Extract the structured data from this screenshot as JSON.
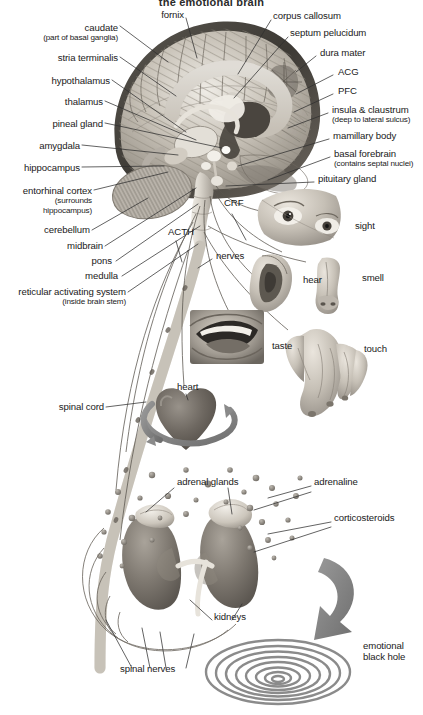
{
  "title": "the emotional brain",
  "figure": {
    "type": "anatomical-diagram",
    "background": "#ffffff",
    "ink": "#1a1a1a"
  },
  "labels": {
    "brain_left": [
      {
        "id": "caudate",
        "text": "caudate",
        "sub": "(part of basal ganglia)",
        "x": 118,
        "y": 28,
        "align": "right"
      },
      {
        "id": "fornix",
        "text": "fornix",
        "sub": "",
        "x": 184,
        "y": 14,
        "align": "right"
      },
      {
        "id": "stria-terminalis",
        "text": "stria terminalis",
        "sub": "",
        "x": 118,
        "y": 57,
        "align": "right"
      },
      {
        "id": "hypothalamus",
        "text": "hypothalamus",
        "sub": "",
        "x": 110,
        "y": 80,
        "align": "right"
      },
      {
        "id": "thalamus",
        "text": "thalamus",
        "sub": "",
        "x": 103,
        "y": 101,
        "align": "right"
      },
      {
        "id": "pineal-gland",
        "text": "pineal gland",
        "sub": "",
        "x": 103,
        "y": 123,
        "align": "right"
      },
      {
        "id": "amygdala",
        "text": "amygdala",
        "sub": "",
        "x": 80,
        "y": 145,
        "align": "right"
      },
      {
        "id": "hippocampus",
        "text": "hippocampus",
        "sub": "",
        "x": 80,
        "y": 167,
        "align": "right"
      },
      {
        "id": "entorhinal-cortex",
        "text": "entorhinal cortex",
        "sub": "(surrounds\nhippocampus)",
        "x": 92,
        "y": 190,
        "align": "right"
      },
      {
        "id": "cerebellum",
        "text": "cerebellum",
        "sub": "",
        "x": 90,
        "y": 229,
        "align": "right"
      },
      {
        "id": "midbrain",
        "text": "midbrain",
        "sub": "",
        "x": 103,
        "y": 245,
        "align": "right"
      },
      {
        "id": "pons",
        "text": "pons",
        "sub": "",
        "x": 114,
        "y": 260,
        "align": "right"
      },
      {
        "id": "medulla",
        "text": "medulla",
        "sub": "",
        "x": 120,
        "y": 275,
        "align": "right"
      },
      {
        "id": "reticular-activating-system",
        "text": "reticular activating system",
        "sub": "(inside brain stem)",
        "x": 126,
        "y": 291,
        "align": "right"
      },
      {
        "id": "spinal-cord",
        "text": "spinal cord",
        "sub": "",
        "x": 104,
        "y": 406,
        "align": "right"
      }
    ],
    "brain_right": [
      {
        "id": "corpus-callosum",
        "text": "corpus callosum",
        "sub": "",
        "x": 273,
        "y": 15,
        "align": "left"
      },
      {
        "id": "septum-pelucidum",
        "text": "septum pelucidum",
        "sub": "",
        "x": 290,
        "y": 32,
        "align": "left"
      },
      {
        "id": "dura-mater",
        "text": "dura mater",
        "sub": "",
        "x": 318,
        "y": 52,
        "align": "left"
      },
      {
        "id": "acg",
        "text": "ACG",
        "sub": "",
        "x": 335,
        "y": 71,
        "align": "left"
      },
      {
        "id": "pfc",
        "text": "PFC",
        "sub": "",
        "x": 335,
        "y": 90,
        "align": "left"
      },
      {
        "id": "insula-claustrum",
        "text": "insula & claustrum",
        "sub": "(deep to lateral sulcus)",
        "x": 330,
        "y": 109,
        "align": "left"
      },
      {
        "id": "mamillary-body",
        "text": "mamillary body",
        "sub": "",
        "x": 331,
        "y": 135,
        "align": "left"
      },
      {
        "id": "basal-forebrain",
        "text": "basal forebrain",
        "sub": "(contains septal nuclei)",
        "x": 332,
        "y": 153,
        "align": "left"
      },
      {
        "id": "pituitary-gland",
        "text": "pituitary gland",
        "sub": "",
        "x": 316,
        "y": 178,
        "align": "left"
      }
    ],
    "pathway": [
      {
        "id": "crf",
        "text": "CRF",
        "x": 222,
        "y": 202,
        "align": "left"
      },
      {
        "id": "acth",
        "text": "ACTH",
        "x": 167,
        "y": 231,
        "align": "left"
      },
      {
        "id": "nerves",
        "text": "nerves",
        "x": 215,
        "y": 255,
        "align": "left"
      }
    ],
    "senses": [
      {
        "id": "sight",
        "text": "sight",
        "x": 353,
        "y": 225,
        "align": "left"
      },
      {
        "id": "hear",
        "text": "hear",
        "x": 301,
        "y": 279,
        "align": "left"
      },
      {
        "id": "smell",
        "text": "smell",
        "x": 360,
        "y": 277,
        "align": "left"
      },
      {
        "id": "taste",
        "text": "taste",
        "x": 270,
        "y": 345,
        "align": "left"
      },
      {
        "id": "touch",
        "text": "touch",
        "x": 362,
        "y": 348,
        "align": "left"
      }
    ],
    "body": [
      {
        "id": "heart",
        "text": "heart",
        "x": 176,
        "y": 386,
        "align": "left"
      },
      {
        "id": "adrenal-glands",
        "text": "adrenal glands",
        "x": 176,
        "y": 481,
        "align": "left"
      },
      {
        "id": "adrenaline",
        "text": "adrenaline",
        "x": 313,
        "y": 481,
        "align": "left"
      },
      {
        "id": "corticosteroids",
        "text": "corticosteroids",
        "x": 333,
        "y": 517,
        "align": "left"
      },
      {
        "id": "kidneys",
        "text": "kidneys",
        "x": 213,
        "y": 616,
        "align": "left"
      },
      {
        "id": "spinal-nerves",
        "text": "spinal nerves",
        "x": 119,
        "y": 668,
        "align": "left"
      },
      {
        "id": "emotional-black-hole",
        "text": "emotional",
        "sub": "black hole",
        "x": 362,
        "y": 645,
        "align": "left"
      }
    ]
  },
  "colors": {
    "ink": "#1a1a1a",
    "leader": "#3a3a3a",
    "tissue_light": "#d8d4cd",
    "tissue_mid": "#a9a49c",
    "tissue_dark": "#6f6a63",
    "tissue_darker": "#4a4640",
    "arrow": "#8a8a8a",
    "spiral": "#8e8e8e"
  }
}
